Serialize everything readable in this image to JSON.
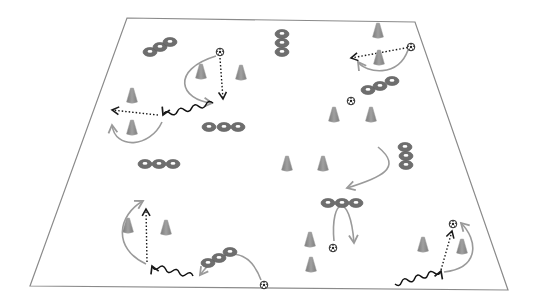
{
  "diagram": {
    "title": "",
    "colors": {
      "background": "#ffffff",
      "field_line": "#8a8a8a",
      "cone": "#8c8c8c",
      "cone_edge": "#a8a8a8",
      "marker": "#6e6e6e",
      "marker_hole": "#ffffff",
      "curve_arrow": "#9a9a9a",
      "dotted_arrow": "#1a1a1a",
      "dribble": "#111111",
      "ball": "#222222"
    },
    "field": {
      "corners": [
        [
          127,
          18
        ],
        [
          415,
          22
        ],
        [
          508,
          290
        ],
        [
          30,
          286
        ]
      ]
    },
    "cones": [
      {
        "x": 201,
        "y": 72
      },
      {
        "x": 241,
        "y": 73
      },
      {
        "x": 132,
        "y": 96
      },
      {
        "x": 132,
        "y": 128
      },
      {
        "x": 378,
        "y": 31
      },
      {
        "x": 379,
        "y": 58
      },
      {
        "x": 334,
        "y": 115
      },
      {
        "x": 371,
        "y": 115
      },
      {
        "x": 287,
        "y": 164
      },
      {
        "x": 323,
        "y": 164
      },
      {
        "x": 128,
        "y": 226
      },
      {
        "x": 166,
        "y": 228
      },
      {
        "x": 310,
        "y": 240
      },
      {
        "x": 311,
        "y": 265
      },
      {
        "x": 423,
        "y": 245
      },
      {
        "x": 462,
        "y": 247
      }
    ],
    "marker_groups": [
      {
        "dir": "diag",
        "points": [
          [
            150,
            52
          ],
          [
            160,
            47
          ],
          [
            170,
            42
          ]
        ]
      },
      {
        "dir": "horiz",
        "points": [
          [
            209,
            127
          ],
          [
            224,
            127
          ],
          [
            238,
            127
          ]
        ]
      },
      {
        "dir": "vert",
        "points": [
          [
            282,
            34
          ],
          [
            282,
            43
          ],
          [
            282,
            52
          ]
        ]
      },
      {
        "dir": "diag",
        "points": [
          [
            368,
            90
          ],
          [
            380,
            86
          ],
          [
            392,
            81
          ]
        ]
      },
      {
        "dir": "vert",
        "points": [
          [
            405,
            147
          ],
          [
            406,
            156
          ],
          [
            406,
            165
          ]
        ]
      },
      {
        "dir": "horiz",
        "points": [
          [
            145,
            164
          ],
          [
            159,
            164
          ],
          [
            173,
            164
          ]
        ]
      },
      {
        "dir": "horiz",
        "points": [
          [
            328,
            203
          ],
          [
            342,
            203
          ],
          [
            356,
            203
          ]
        ]
      },
      {
        "dir": "diag",
        "points": [
          [
            208,
            263
          ],
          [
            219,
            258
          ],
          [
            230,
            252
          ]
        ]
      }
    ],
    "balls": [
      {
        "x": 220,
        "y": 52
      },
      {
        "x": 411,
        "y": 47
      },
      {
        "x": 351,
        "y": 101
      },
      {
        "x": 333,
        "y": 248
      },
      {
        "x": 264,
        "y": 285
      },
      {
        "x": 453,
        "y": 224
      }
    ],
    "curved_arrows": [
      {
        "d": "M 216 56 C 170 70, 180 100, 212 103"
      },
      {
        "d": "M 162 122 C 150 148, 115 150, 112 125"
      },
      {
        "d": "M 408 50 C 398 78, 366 73, 358 62"
      },
      {
        "d": "M 378 147 C 404 168, 380 178, 347 188"
      },
      {
        "d": "M 334 241 C 330 198, 350 190, 354 243"
      },
      {
        "d": "M 146 264 C 112 248, 118 215, 143 201"
      },
      {
        "d": "M 261 280 C 248 245, 220 248, 200 275"
      },
      {
        "d": "M 444 272 C 480 268, 478 240, 461 223"
      }
    ],
    "dotted_arrows": [
      {
        "x1": 220,
        "y1": 58,
        "x2": 223,
        "y2": 99
      },
      {
        "x1": 411,
        "y1": 47,
        "x2": 351,
        "y2": 58
      },
      {
        "x1": 158,
        "y1": 115,
        "x2": 112,
        "y2": 110
      },
      {
        "x1": 147,
        "y1": 262,
        "x2": 146,
        "y2": 209
      },
      {
        "x1": 441,
        "y1": 270,
        "x2": 452,
        "y2": 231
      }
    ],
    "dribble_arrows": [
      {
        "x1": 213,
        "y1": 103,
        "x2": 163,
        "y2": 115
      },
      {
        "x1": 193,
        "y1": 276,
        "x2": 152,
        "y2": 266
      },
      {
        "x1": 395,
        "y1": 284,
        "x2": 441,
        "y2": 271
      }
    ],
    "legend": []
  }
}
